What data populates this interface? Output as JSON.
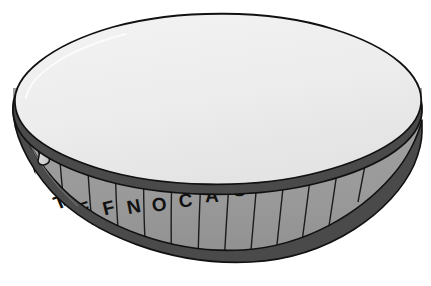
{
  "illustration": {
    "title": "Drum",
    "subject": "drum",
    "view": "three-quarter perspective, tilted",
    "style": "flat grayscale line illustration",
    "background_color": "#ffffff",
    "outline_color": "#111111"
  },
  "colors": {
    "background": "#ffffff",
    "head_top": "#ededed",
    "head_highlight": "#f5f5f5",
    "shell_body": "#9a9a9a",
    "shell_shadow": "#8e8e8e",
    "rim_top": "#4a4a4a",
    "rim_bottom": "#4a4a4a",
    "rim_edge_light": "#6e6e6e",
    "lug_fill": "#dcdcdc",
    "lug_shadow": "#b4b4b4",
    "outline": "#111111",
    "letter": "#111111"
  },
  "parts": {
    "head_label": "drum head",
    "top_rim_label": "top rim hoop",
    "bottom_rim_label": "bottom rim hoop",
    "shell_label": "drum shell",
    "lug_label": "tuning lug",
    "stave_label": "shell stave seam"
  },
  "shell": {
    "letters": [
      "T",
      "E",
      "F",
      "N",
      "O",
      "C",
      "A",
      "S",
      "G",
      "I",
      "D",
      "R"
    ],
    "letter_string": "TEFNOCASGIDR",
    "letter_count": 12,
    "stave_count": 13,
    "lug_count": 5
  },
  "letter_positions": [
    {
      "char": "T",
      "x": 62,
      "y": 208,
      "rotate": -22
    },
    {
      "char": "E",
      "x": 86,
      "y": 215,
      "rotate": -18
    },
    {
      "char": "F",
      "x": 110,
      "y": 214,
      "rotate": -14
    },
    {
      "char": "N",
      "x": 135,
      "y": 213,
      "rotate": -11
    },
    {
      "char": "O",
      "x": 160,
      "y": 211,
      "rotate": -8
    },
    {
      "char": "C",
      "x": 186,
      "y": 207,
      "rotate": -5
    },
    {
      "char": "A",
      "x": 212,
      "y": 202,
      "rotate": -2
    },
    {
      "char": "S",
      "x": 239,
      "y": 196,
      "rotate": 2
    },
    {
      "char": "G",
      "x": 265,
      "y": 188,
      "rotate": 5
    },
    {
      "char": "I",
      "x": 292,
      "y": 177,
      "rotate": 8
    },
    {
      "char": "D",
      "x": 322,
      "y": 163,
      "rotate": 11
    },
    {
      "char": "R",
      "x": 354,
      "y": 146,
      "rotate": 14
    }
  ],
  "lug_positions": [
    {
      "x": 42,
      "y": 148,
      "rotate": -16
    },
    {
      "x": 130,
      "y": 148,
      "rotate": -8
    },
    {
      "x": 209,
      "y": 136,
      "rotate": -2
    },
    {
      "x": 288,
      "y": 116,
      "rotate": 6
    },
    {
      "x": 373,
      "y": 84,
      "rotate": 14
    }
  ]
}
